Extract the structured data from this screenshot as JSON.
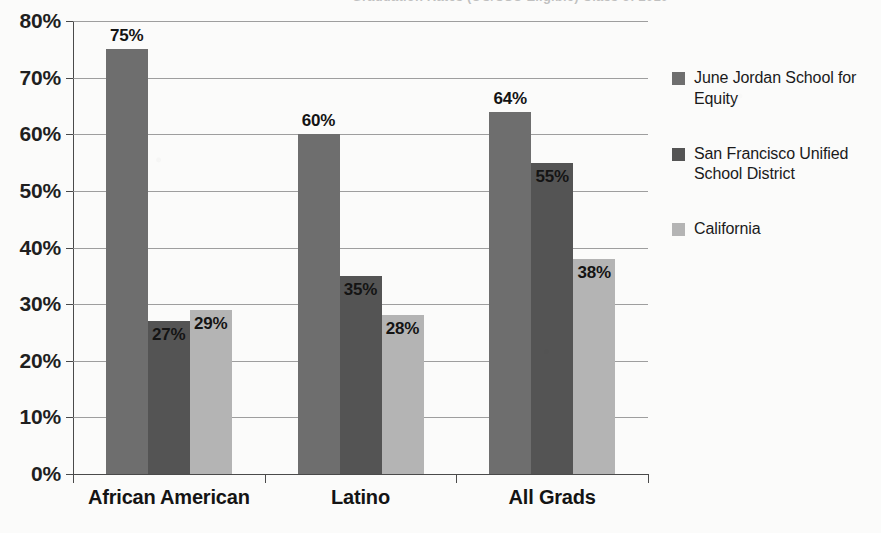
{
  "chart_data": {
    "type": "bar",
    "title": "Graduation Rates (UC/CSU Eligible) Class of 2010",
    "categories": [
      "African American",
      "Latino",
      "All Grads"
    ],
    "series": [
      {
        "name": "June Jordan School for Equity",
        "color": "#6e6e6e",
        "values": [
          75,
          60,
          64
        ],
        "labels": [
          "75%",
          "60%",
          "64%"
        ],
        "label_positions": [
          "above",
          "above",
          "above"
        ]
      },
      {
        "name": "San Francisco Unified School District",
        "color": "#545454",
        "values": [
          27,
          35,
          55
        ],
        "labels": [
          "27%",
          "35%",
          "55%"
        ],
        "label_positions": [
          "inside",
          "inside",
          "inside"
        ]
      },
      {
        "name": "California",
        "color": "#b4b4b4",
        "values": [
          29,
          28,
          38
        ],
        "labels": [
          "29%",
          "28%",
          "38%"
        ],
        "label_positions": [
          "inside",
          "inside",
          "inside"
        ]
      }
    ],
    "ylim": [
      0,
      80
    ],
    "yticks": [
      0,
      10,
      20,
      30,
      40,
      50,
      60,
      70,
      80
    ],
    "ytick_labels": [
      "0%",
      "10%",
      "20%",
      "30%",
      "40%",
      "50%",
      "60%",
      "70%",
      "80%"
    ],
    "xlabel": "",
    "ylabel": "",
    "grid": true,
    "legend_position": "right"
  },
  "legend": {
    "items": [
      {
        "label": "June Jordan School for Equity",
        "color": "#6e6e6e"
      },
      {
        "label": "San Francisco Unified School District",
        "color": "#545454"
      },
      {
        "label": "California",
        "color": "#b4b4b4"
      }
    ]
  }
}
